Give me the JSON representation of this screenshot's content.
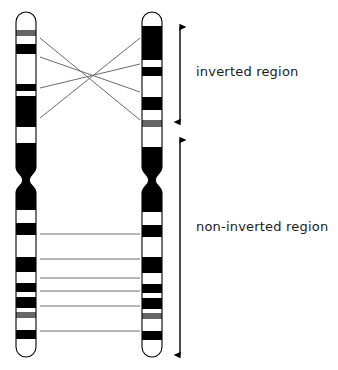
{
  "figure": {
    "type": "diagram",
    "width": 338,
    "height": 370,
    "background_color": "#ffffff",
    "band_colors": {
      "dark": "#000000",
      "gray": "#666666",
      "light": "#ffffff",
      "outline": "#000000",
      "connector_line": "#6b6b6b",
      "arrow": "#000000"
    }
  },
  "labels": {
    "inverted_region": "inverted region",
    "non_inverted_region": "non-inverted region"
  },
  "chromosomes": [
    {
      "id": "left-chromosome",
      "name": "left-chromosome",
      "x": 16,
      "width": 20,
      "top": 12,
      "bottom": 357,
      "centromere_y": 180,
      "bands": [
        {
          "start": 12,
          "end": 30,
          "shade": "light"
        },
        {
          "start": 30,
          "end": 36,
          "shade": "gray"
        },
        {
          "start": 36,
          "end": 44,
          "shade": "light"
        },
        {
          "start": 44,
          "end": 54,
          "shade": "dark"
        },
        {
          "start": 54,
          "end": 84,
          "shade": "light"
        },
        {
          "start": 84,
          "end": 91,
          "shade": "dark"
        },
        {
          "start": 91,
          "end": 96,
          "shade": "light"
        },
        {
          "start": 96,
          "end": 127,
          "shade": "dark"
        },
        {
          "start": 127,
          "end": 143,
          "shade": "light"
        },
        {
          "start": 143,
          "end": 210,
          "shade": "dark"
        },
        {
          "start": 210,
          "end": 223,
          "shade": "light"
        },
        {
          "start": 223,
          "end": 235,
          "shade": "dark"
        },
        {
          "start": 235,
          "end": 257,
          "shade": "light"
        },
        {
          "start": 257,
          "end": 272,
          "shade": "dark"
        },
        {
          "start": 272,
          "end": 283,
          "shade": "light"
        },
        {
          "start": 283,
          "end": 292,
          "shade": "dark"
        },
        {
          "start": 292,
          "end": 297,
          "shade": "light"
        },
        {
          "start": 297,
          "end": 308,
          "shade": "dark"
        },
        {
          "start": 308,
          "end": 312,
          "shade": "light"
        },
        {
          "start": 312,
          "end": 318,
          "shade": "gray"
        },
        {
          "start": 318,
          "end": 330,
          "shade": "light"
        },
        {
          "start": 330,
          "end": 339,
          "shade": "dark"
        },
        {
          "start": 339,
          "end": 357,
          "shade": "light"
        }
      ]
    },
    {
      "id": "right-chromosome",
      "name": "right-chromosome",
      "x": 142,
      "width": 20,
      "top": 12,
      "bottom": 357,
      "centromere_y": 180,
      "bands": [
        {
          "start": 12,
          "end": 26,
          "shade": "light"
        },
        {
          "start": 26,
          "end": 60,
          "shade": "dark"
        },
        {
          "start": 60,
          "end": 67,
          "shade": "light"
        },
        {
          "start": 67,
          "end": 76,
          "shade": "dark"
        },
        {
          "start": 76,
          "end": 97,
          "shade": "light"
        },
        {
          "start": 97,
          "end": 110,
          "shade": "dark"
        },
        {
          "start": 110,
          "end": 120,
          "shade": "light"
        },
        {
          "start": 120,
          "end": 127,
          "shade": "gray"
        },
        {
          "start": 127,
          "end": 147,
          "shade": "light"
        },
        {
          "start": 147,
          "end": 212,
          "shade": "dark"
        },
        {
          "start": 212,
          "end": 225,
          "shade": "light"
        },
        {
          "start": 225,
          "end": 237,
          "shade": "dark"
        },
        {
          "start": 237,
          "end": 257,
          "shade": "light"
        },
        {
          "start": 257,
          "end": 273,
          "shade": "dark"
        },
        {
          "start": 273,
          "end": 284,
          "shade": "light"
        },
        {
          "start": 284,
          "end": 293,
          "shade": "dark"
        },
        {
          "start": 293,
          "end": 298,
          "shade": "light"
        },
        {
          "start": 298,
          "end": 309,
          "shade": "dark"
        },
        {
          "start": 309,
          "end": 313,
          "shade": "light"
        },
        {
          "start": 313,
          "end": 319,
          "shade": "gray"
        },
        {
          "start": 319,
          "end": 331,
          "shade": "light"
        },
        {
          "start": 331,
          "end": 340,
          "shade": "dark"
        },
        {
          "start": 340,
          "end": 357,
          "shade": "light"
        }
      ]
    }
  ],
  "connectors": {
    "crossing_lines": [
      {
        "x1": 40,
        "y1": 38,
        "x2": 140,
        "y2": 120
      },
      {
        "x1": 40,
        "y1": 57,
        "x2": 140,
        "y2": 92
      },
      {
        "x1": 40,
        "y1": 88,
        "x2": 140,
        "y2": 64
      },
      {
        "x1": 40,
        "y1": 118,
        "x2": 140,
        "y2": 38
      }
    ],
    "parallel_lines": [
      {
        "x1": 40,
        "y1": 234,
        "x2": 140,
        "y2": 234
      },
      {
        "x1": 40,
        "y1": 259,
        "x2": 140,
        "y2": 259
      },
      {
        "x1": 40,
        "y1": 278,
        "x2": 140,
        "y2": 278
      },
      {
        "x1": 40,
        "y1": 291,
        "x2": 140,
        "y2": 291
      },
      {
        "x1": 40,
        "y1": 306,
        "x2": 140,
        "y2": 306
      },
      {
        "x1": 40,
        "y1": 331,
        "x2": 140,
        "y2": 331
      }
    ]
  },
  "arrows": [
    {
      "id": "inverted-region-arrow",
      "x": 180,
      "y1": 27,
      "y2": 122
    },
    {
      "id": "non-inverted-region-arrow",
      "x": 180,
      "y1": 140,
      "y2": 355
    }
  ]
}
